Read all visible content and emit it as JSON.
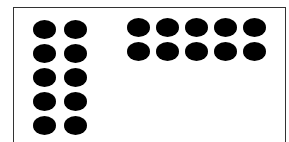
{
  "figure": {
    "colors": {
      "dot": "#000000",
      "border": "#333333",
      "background": "#ffffff"
    },
    "groups": [
      {
        "name": "left-array",
        "rows": 5,
        "columns": 2,
        "count": 10,
        "origin": [
          33,
          20
        ],
        "step": [
          31,
          24
        ]
      },
      {
        "name": "right-array",
        "rows": 2,
        "columns": 5,
        "count": 10,
        "origin": [
          127,
          18
        ],
        "step": [
          29,
          24
        ]
      }
    ]
  }
}
